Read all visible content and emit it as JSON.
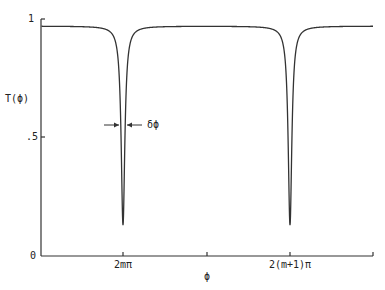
{
  "chart_data": {
    "type": "line",
    "title": "",
    "xlabel": "ϕ",
    "ylabel": "T(ϕ)",
    "ylim": [
      0,
      1
    ],
    "yticks": [
      {
        "value": 0,
        "label": "0"
      },
      {
        "value": 0.5,
        "label": ".5"
      },
      {
        "value": 1,
        "label": "1"
      }
    ],
    "xticks": [
      {
        "position": 0.0,
        "label": ""
      },
      {
        "position": 0.25,
        "label": "2mπ"
      },
      {
        "position": 0.5,
        "label": ""
      },
      {
        "position": 0.75,
        "label": "2(m+1)π"
      },
      {
        "position": 1.0,
        "label": ""
      }
    ],
    "grid": false,
    "legend": null,
    "series": [
      {
        "name": "T(ϕ)",
        "description": "Periodic transmission function with sharp dips at ϕ = 2mπ and 2(m+1)π",
        "baseline": 0.97,
        "minimum": 0.13,
        "dip_positions": [
          "2mπ",
          "2(m+1)π"
        ]
      }
    ],
    "annotations": [
      {
        "text": "δϕ",
        "description": "Width of dip indicated by inward arrows at y ≈ 0.5"
      }
    ]
  }
}
